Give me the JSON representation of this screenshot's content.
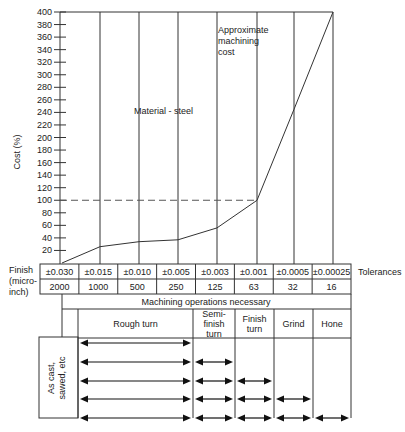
{
  "chart_data": {
    "type": "line",
    "title": "",
    "ylabel": "Cost (%)",
    "xlabel": "Tolerances",
    "ylim": [
      0,
      400
    ],
    "yticks": [
      20,
      40,
      60,
      80,
      100,
      120,
      140,
      160,
      180,
      200,
      220,
      240,
      260,
      280,
      300,
      320,
      340,
      360,
      380,
      400
    ],
    "categories": [
      "±0.030",
      "±0.015",
      "±0.010",
      "±0.005",
      "±0.003",
      "±0.001",
      "±0.0005",
      "±0.00025"
    ],
    "finish_microinch": [
      "2000",
      "1000",
      "500",
      "250",
      "125",
      "63",
      "32",
      "16"
    ],
    "series": [
      {
        "name": "Approximate machining cost",
        "x": [
          "start",
          "±0.015",
          "±0.010",
          "±0.005",
          "±0.003",
          "±0.001",
          "±0.0005",
          "±0.00025"
        ],
        "values": [
          0,
          26,
          34,
          37,
          56,
          100,
          245,
          400
        ]
      }
    ],
    "reference_line": {
      "value": 100,
      "style": "dashed"
    },
    "annotations": [
      "Material - steel",
      "Approximate machining cost"
    ],
    "grid": "vertical"
  },
  "labels": {
    "y_axis": "Cost (%)",
    "material": "Material - steel",
    "approx_1": "Approximate",
    "approx_2": "machining",
    "approx_3": "cost",
    "finish_1": "Finish",
    "finish_2": "(micro-",
    "finish_3": "inch)",
    "tolerances": "Tolerances",
    "ops_header": "Machining operations necessary",
    "as_cast_1": "As cast,",
    "as_cast_2": "sawed, etc"
  },
  "operations": [
    {
      "lines": [
        "Rough turn"
      ]
    },
    {
      "lines": [
        "Semi-",
        "finish",
        "turn"
      ]
    },
    {
      "lines": [
        "Finish",
        "turn"
      ]
    },
    {
      "lines": [
        "Grind"
      ]
    },
    {
      "lines": [
        "Hone"
      ]
    }
  ],
  "arrow_rows": [
    [
      "Rough turn"
    ],
    [
      "Rough turn",
      "Semi-finish turn"
    ],
    [
      "Rough turn",
      "Semi-finish turn",
      "Finish turn"
    ],
    [
      "Rough turn",
      "Semi-finish turn",
      "Finish turn",
      "Grind"
    ],
    [
      "Rough turn",
      "Semi-finish turn",
      "Finish turn",
      "Grind",
      "Hone"
    ]
  ]
}
